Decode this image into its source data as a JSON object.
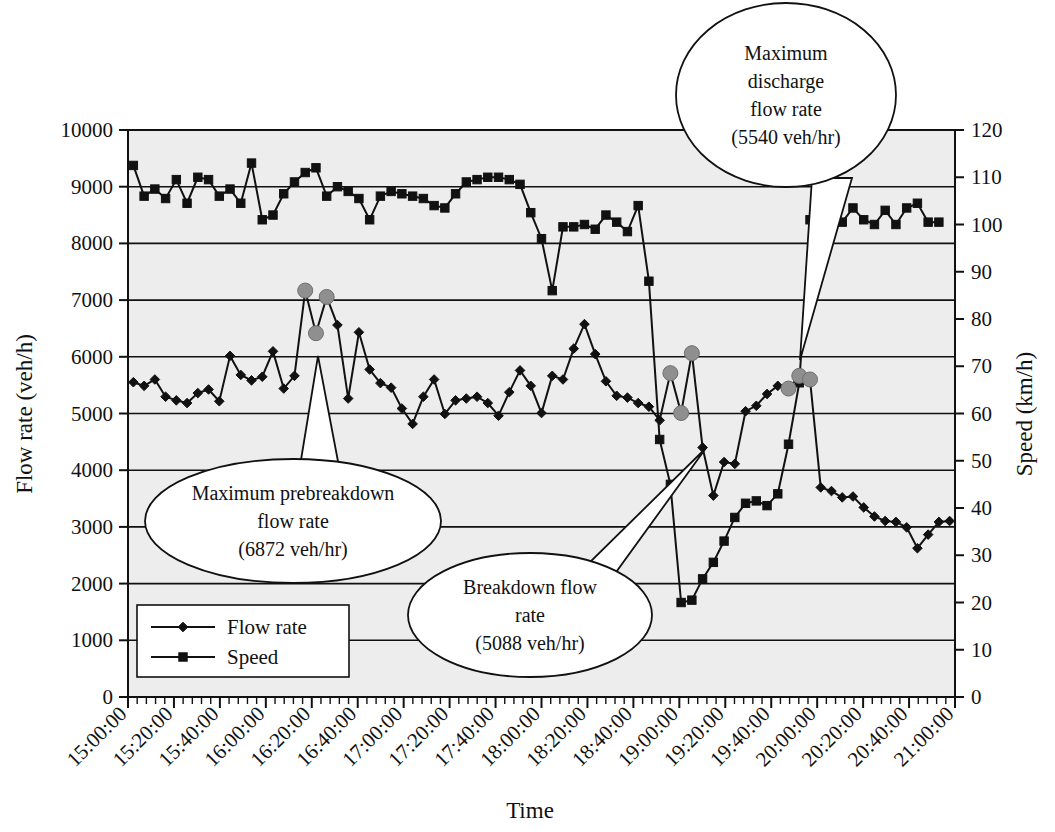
{
  "chart_data": {
    "type": "line",
    "title": "",
    "xlabel": "Time",
    "ylabel": "Flow rate (veh/h)",
    "y2label": "Speed (km/h)",
    "ylim": [
      0,
      10000
    ],
    "y2lim": [
      0,
      120
    ],
    "grid": true,
    "legend_position": "lower-left-inside",
    "y_ticks": [
      "0",
      "1000",
      "2000",
      "3000",
      "4000",
      "5000",
      "6000",
      "7000",
      "8000",
      "9000",
      "10000"
    ],
    "y2_ticks": [
      "0",
      "10",
      "20",
      "30",
      "40",
      "50",
      "60",
      "70",
      "80",
      "90",
      "100",
      "110",
      "120"
    ],
    "x_ticks": [
      "15:00:00",
      "15:20:00",
      "15:40:00",
      "16:00:00",
      "16:20:00",
      "16:40:00",
      "17:00:00",
      "17:20:00",
      "17:40:00",
      "18:00:00",
      "18:20:00",
      "18:40:00",
      "19:00:00",
      "19:20:00",
      "19:40:00",
      "20:00:00",
      "20:20:00",
      "20:40:00",
      "21:00:00"
    ],
    "x_start_minutes": 900,
    "x_end_minutes": 1260,
    "x_minor_interval_minutes": 4,
    "x_major_interval_minutes": 20,
    "series": [
      {
        "name": "Flow rate",
        "axis": "left",
        "marker": "diamond",
        "color": "#111111",
        "unit": "veh/h",
        "values": [
          5552,
          5488,
          5600,
          5296,
          5232,
          5184,
          5360,
          5424,
          5216,
          6016,
          5680,
          5584,
          5648,
          6096,
          5440,
          5664,
          7168,
          6416,
          7056,
          6560,
          5264,
          6432,
          5776,
          5536,
          5456,
          5088,
          4816,
          5296,
          5600,
          4992,
          5232,
          5264,
          5296,
          5184,
          4960,
          5376,
          5760,
          5488,
          5008,
          5664,
          5600,
          6144,
          6576,
          6048,
          5568,
          5312,
          5280,
          5184,
          5120,
          4880,
          5712,
          5008,
          6064,
          4400,
          3552,
          4144,
          4112,
          5040,
          5136,
          5344,
          5488,
          5440,
          5664,
          5600,
          3696,
          3632,
          3520,
          3536,
          3344,
          3184,
          3104,
          3088,
          2992,
          2624,
          2864,
          3088,
          3104
        ]
      },
      {
        "name": "Speed",
        "axis": "right",
        "marker": "square",
        "color": "#111111",
        "unit": "km/h",
        "values": [
          112.5,
          106,
          107.5,
          105.5,
          109.5,
          104.5,
          110,
          109.5,
          106,
          107.5,
          104.5,
          113,
          101,
          102,
          106.5,
          109,
          111,
          112,
          106,
          108,
          107,
          105.5,
          101,
          106,
          107,
          106.5,
          106,
          105.5,
          104,
          103.5,
          106.5,
          109,
          109.5,
          110,
          110,
          109.5,
          108.5,
          102.5,
          97,
          86,
          99.5,
          99.5,
          100,
          99,
          102,
          100.5,
          98.5,
          104,
          88,
          54.5,
          45,
          20,
          20.5,
          25,
          28.5,
          33,
          38,
          41,
          41.5,
          40.5,
          43,
          53.5,
          66.5,
          101,
          104.5,
          100.5,
          100.5,
          103.5,
          101,
          100,
          103,
          100,
          103.5,
          104.5,
          100.5,
          100.5
        ]
      }
    ],
    "highlighted_points": [
      {
        "series": "Flow rate",
        "index": 16,
        "value": 7168,
        "note": "pre-breakdown peak"
      },
      {
        "series": "Flow rate",
        "index": 17,
        "value": 6416,
        "note": "pre-breakdown"
      },
      {
        "series": "Flow rate",
        "index": 18,
        "value": 7056,
        "note": "pre-breakdown"
      },
      {
        "series": "Flow rate",
        "index": 50,
        "value": 5712,
        "note": "prebreakdown"
      },
      {
        "series": "Flow rate",
        "index": 51,
        "value": 5008,
        "note": "breakdown"
      },
      {
        "series": "Flow rate",
        "index": 52,
        "value": 6064,
        "note": "prebreakdown max"
      },
      {
        "series": "Flow rate",
        "index": 61,
        "value": 5440,
        "note": "discharge"
      },
      {
        "series": "Flow rate",
        "index": 62,
        "value": 5664,
        "note": "discharge"
      },
      {
        "series": "Flow rate",
        "index": 63,
        "value": 5600,
        "note": "max discharge"
      }
    ],
    "annotations": [
      {
        "id": "max-discharge",
        "lines": [
          "Maximum",
          "discharge",
          "flow rate",
          "(5540 veh/hr)"
        ],
        "value": 5540,
        "unit": "veh/hr"
      },
      {
        "id": "max-prebreakdown",
        "lines": [
          "Maximum prebreakdown",
          "flow rate",
          "(6872 veh/hr)"
        ],
        "value": 6872,
        "unit": "veh/hr"
      },
      {
        "id": "breakdown",
        "lines": [
          "Breakdown flow",
          "rate",
          "(5088 veh/hr)"
        ],
        "value": 5088,
        "unit": "veh/hr"
      }
    ],
    "legend": [
      {
        "label": "Flow rate",
        "marker": "diamond"
      },
      {
        "label": "Speed",
        "marker": "square"
      }
    ],
    "colors": {
      "plot_background": "#ededed",
      "line": "#111111",
      "highlight": "#8f8f8f",
      "grid": "#111111"
    }
  }
}
